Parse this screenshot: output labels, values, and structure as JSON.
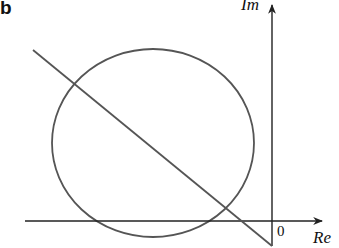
{
  "figure": {
    "panel_label": "b",
    "axes": {
      "x_label": "Re",
      "y_label": "Im",
      "origin_label": "0"
    },
    "elements": [
      {
        "type": "circle",
        "description": "circle in complex plane, left of imaginary axis, slightly below real axis at its bottom"
      },
      {
        "type": "line",
        "description": "straight line descending from upper-left to lower-right, crossing real axis left of origin"
      }
    ],
    "colors": {
      "stroke": "#555555",
      "axis": "#222222",
      "text": "#111111"
    }
  }
}
